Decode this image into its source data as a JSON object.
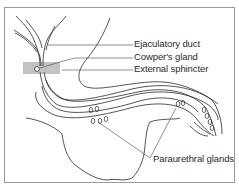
{
  "diagram": {
    "labels": {
      "ejaculatory_duct": "Ejaculatory duct",
      "cowpers_gland": "Cowper's gland",
      "external_sphincter": "External sphincter",
      "paraurethral_glands": "Paraurethral glands"
    },
    "colors": {
      "line": "#2a2a2a",
      "frame": "#9a9a9a",
      "sphincter": "#555555",
      "background": "#ffffff"
    }
  }
}
